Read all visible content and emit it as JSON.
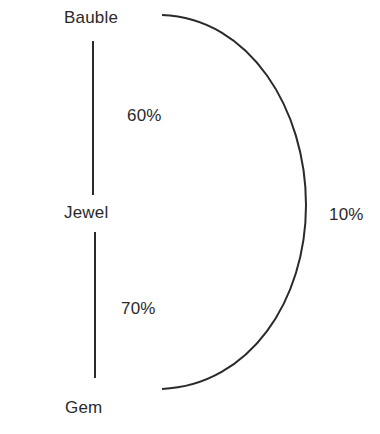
{
  "diagram": {
    "nodes": [
      {
        "id": "bauble",
        "label": "Bauble"
      },
      {
        "id": "jewel",
        "label": "Jewel"
      },
      {
        "id": "gem",
        "label": "Gem"
      }
    ],
    "edges": [
      {
        "from": "bauble",
        "to": "jewel",
        "label": "60%",
        "shape": "straight"
      },
      {
        "from": "jewel",
        "to": "gem",
        "label": "70%",
        "shape": "straight"
      },
      {
        "from": "bauble",
        "to": "gem",
        "label": "10%",
        "shape": "arc"
      }
    ],
    "colors": {
      "line": "#2a2a2a",
      "text": "#2a2a2a",
      "background": "#ffffff"
    }
  }
}
